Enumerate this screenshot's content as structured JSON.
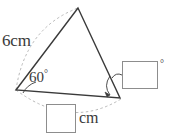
{
  "figure": {
    "type": "geometry-diagram",
    "shape": "triangle",
    "stroke_color": "#3a3a3a",
    "dashed_color": "#b4b4b4",
    "box_border_color": "#8d8d8d",
    "background_color": "#ffffff",
    "vertices": {
      "apex": {
        "x": 78,
        "y": 8
      },
      "left": {
        "x": 16,
        "y": 90
      },
      "right": {
        "x": 120,
        "y": 98
      }
    },
    "labels": {
      "side_left": "6cm",
      "angle_left": "60",
      "angle_left_degree_symbol": "°",
      "unit_bottom": "cm",
      "degree_symbol_box": "°"
    },
    "answers": {
      "angle_value": "",
      "length_value": ""
    },
    "annotations": {
      "arc_side_left": "dashed arc spanning the 6cm side from left vertex to apex",
      "arc_base": "dashed arc spanning the base from left vertex to right vertex",
      "angle_mark_left": "angle arc at left vertex marking 60 degrees",
      "angle_mark_right": "angle arc with arrow at right vertex pointing to the answer box",
      "leader_line": "curved leader line from right answer box to right vertex angle"
    }
  }
}
